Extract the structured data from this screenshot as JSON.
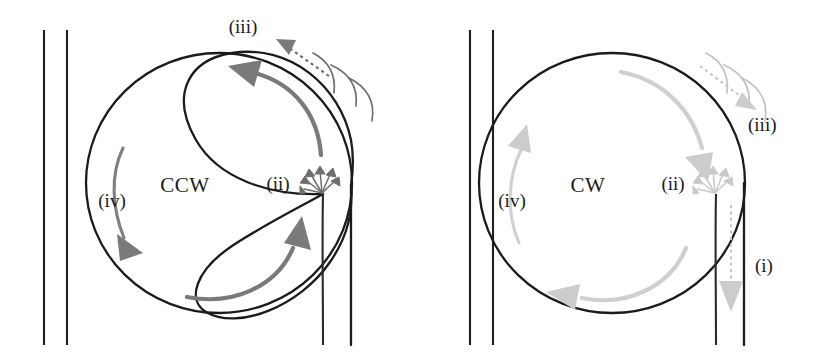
{
  "figure": {
    "background_color": "#ffffff",
    "width": 814,
    "height": 359
  },
  "palette": {
    "wall_line": "#20201f",
    "bubble_outline": "#1b1b1b",
    "accent_dark_gray": "#7a7a7a",
    "accent_light_gray": "#cfcfcf",
    "text": "#1a1a1a"
  },
  "panels": [
    {
      "id": "left",
      "mode_label": "CCW",
      "rotation": "counter-clockwise",
      "emphasis": "dark",
      "labels": [
        {
          "key": "iii",
          "text": "(iii)",
          "x": 243,
          "y": 33
        },
        {
          "key": "ii",
          "text": "(ii)",
          "x": 278,
          "y": 190
        },
        {
          "key": "iv",
          "text": "(iv)",
          "x": 112,
          "y": 207
        },
        {
          "key": "mode",
          "text": "CCW",
          "x": 185,
          "y": 192
        }
      ],
      "features": {
        "wall_lines": 2,
        "whiskers": 3,
        "burst_arrows": 6,
        "flow_arrows": 3,
        "ejection_arrow": false
      }
    },
    {
      "id": "right",
      "mode_label": "CW",
      "rotation": "clockwise",
      "emphasis": "light",
      "labels": [
        {
          "key": "iii",
          "text": "(iii)",
          "x": 748,
          "y": 131
        },
        {
          "key": "ii",
          "text": "(ii)",
          "x": 673,
          "y": 190
        },
        {
          "key": "iv",
          "text": "(iv)",
          "x": 512,
          "y": 207
        },
        {
          "key": "i",
          "text": "(i)",
          "x": 755,
          "y": 272
        },
        {
          "key": "mode",
          "text": "CW",
          "x": 588,
          "y": 192
        }
      ],
      "features": {
        "wall_lines": 2,
        "whiskers": 3,
        "burst_arrows": 6,
        "flow_arrows": 3,
        "ejection_arrow": true
      }
    }
  ],
  "legend_keys": {
    "i": "(i)",
    "ii": "(ii)",
    "iii": "(iii)",
    "iv": "(iv)"
  }
}
